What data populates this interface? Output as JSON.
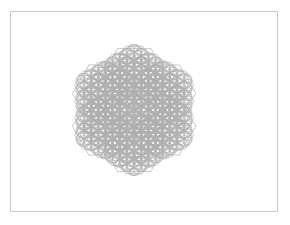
{
  "canvas": {
    "width": 290,
    "height": 225,
    "background_color": "#ffffff",
    "title": "Recursive Hexagon Figure"
  },
  "frame": {
    "name": "border-frame",
    "x": 10.5,
    "y": 11.5,
    "width": 267,
    "height": 200,
    "stroke_color": "#c9c9c9",
    "stroke_width": 1,
    "fill": "none"
  },
  "figure": {
    "name": "recursive-hexagon-fractal",
    "center_x": 134,
    "center_y": 110,
    "orientation": "flat-top",
    "base_radius": 33,
    "ring_distance_factor": 1.0,
    "child_scale": 0.5,
    "children_per_node": 6,
    "recursion_depth": 4,
    "stroke_color": "#b0b0b0",
    "stroke_width": 0.7,
    "fill": "none",
    "bounds": {
      "left": 79,
      "right": 190,
      "top": 48,
      "bottom": 172
    },
    "vertex_angles_deg": [
      0,
      60,
      120,
      180,
      240,
      300
    ],
    "ring_angles_deg": [
      30,
      90,
      150,
      210,
      270,
      330
    ]
  },
  "chart_data": {
    "type": "scatter",
    "xlabel": "",
    "ylabel": "",
    "levels": [
      {
        "level": 0,
        "count": 1,
        "radius": 33,
        "ring_radius": 0
      },
      {
        "level": 1,
        "count": 6,
        "radius": 33,
        "ring_radius": 33
      },
      {
        "level": 2,
        "count": 6,
        "radius": 16.5,
        "ring_radius": 16.5
      },
      {
        "level": 3,
        "count": 6,
        "radius": 8.25,
        "ring_radius": 8.25
      },
      {
        "level": 4,
        "count": 6,
        "radius": 4.13,
        "ring_radius": 4.13
      }
    ],
    "legend": []
  }
}
